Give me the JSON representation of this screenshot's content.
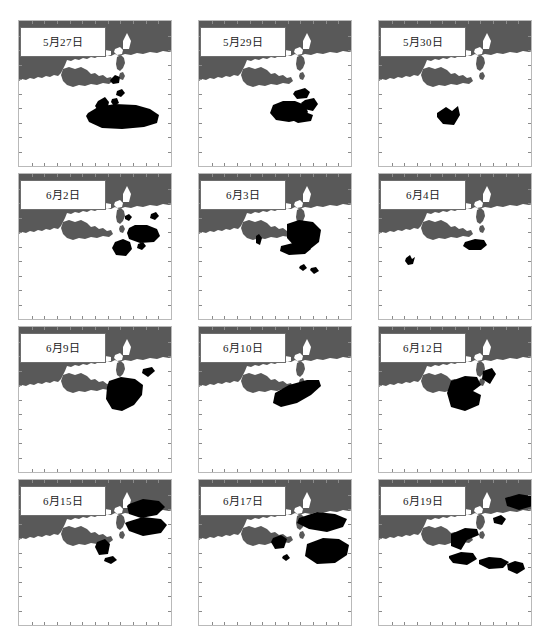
{
  "figure": {
    "title": "",
    "caption": "",
    "colors": {
      "land": "#595959",
      "sea": "#ffffff",
      "bloom": "#000000",
      "frame": "#b9b9b9",
      "tick": "#8a8a8a",
      "label_border": "#6d6d6d",
      "label_bg": "#ffffff",
      "text": "#1a1a1a"
    },
    "grid": {
      "rows": 4,
      "cols": 3,
      "panel_count": 12
    }
  },
  "chart_data": {
    "type": "map",
    "title": "",
    "xlabel": "",
    "ylabel": "",
    "legend": [
      {
        "label": "land",
        "color": "#595959"
      },
      {
        "label": "sea",
        "color": "#ffffff"
      },
      {
        "label": "bloom-patch",
        "color": "#000000"
      }
    ],
    "panels": [
      {
        "index": 0,
        "row": 1,
        "col": 1,
        "date_label": "5月27日",
        "month": 5,
        "day": 27,
        "patch_count": 6,
        "patch_area_relative": 0.105,
        "patches": [
          "M92,58 l4,-4 5,2 -1,6 -6,1 -3,-3 z",
          "M98,70 l5,-2 3,4 -4,4 -5,-2 z",
          "M79,80 l7,-4 4,5 -2,9 -8,1 -4,-6 z",
          "M93,78 l5,-1 2,5 -5,3 -3,-4 z",
          "M69,92 l10,-6 17,-3 21,1 14,4 9,6 -2,8 -13,4 -22,2 -20,-1 -13,-6 -3,-6 z",
          "M86,96 l9,-2 5,4 -4,5 -9,-1 -3,-4 z"
        ]
      },
      {
        "index": 1,
        "row": 1,
        "col": 2,
        "date_label": "5月29日",
        "month": 5,
        "day": 29,
        "patch_count": 4,
        "patch_area_relative": 0.09,
        "patches": [
          "M96,70 l10,-3 5,4 -3,6 -10,1 -4,-5 z",
          "M106,79 l9,-2 4,6 -5,7 -9,-2 -3,-6 z",
          "M74,84 l10,-4 12,0 10,4 3,7 -5,7 -14,3 -13,-2 -6,-7 z",
          "M93,92 l13,-1 8,3 -2,6 -13,2 -8,-4 z"
        ]
      },
      {
        "index": 2,
        "row": 1,
        "col": 3,
        "date_label": "5月30日",
        "month": 5,
        "day": 30,
        "patch_count": 1,
        "patch_area_relative": 0.018,
        "patches": [
          "M58,92 l9,-6 6,4 6,-5 2,9 -6,10 -11,-1 -6,-7 z"
        ]
      },
      {
        "index": 3,
        "row": 2,
        "col": 1,
        "date_label": "6月2日",
        "month": 6,
        "day": 2,
        "patch_count": 5,
        "patch_area_relative": 0.052,
        "patches": [
          "M106,42 l4,-2 3,3 -3,4 -4,-2 z",
          "M132,40 l5,-2 3,4 -4,4 -5,-2 z",
          "M110,54 l6,-3 12,0 10,4 3,7 -6,6 -14,1 -11,-4 -2,-6 z",
          "M119,70 l5,-2 3,4 -4,4 -5,-2 z",
          "M96,68 l8,-3 7,3 2,7 -6,7 -10,-1 -4,-7 z"
        ]
      },
      {
        "index": 4,
        "row": 2,
        "col": 2,
        "date_label": "6月3日",
        "month": 6,
        "day": 3,
        "patch_count": 5,
        "patch_area_relative": 0.078,
        "patches": [
          "M88,50 l12,-4 14,2 8,8 -2,12 -10,8 -13,-2 -9,-10 z",
          "M57,62 l3,-2 3,4 -2,7 -4,-2 z",
          "M82,72 l12,-3 14,1 4,5 -6,5 -16,1 -9,-4 z",
          "M101,92 l4,-2 3,4 -4,3 -4,-3 z",
          "M112,94 l5,-1 3,4 -5,3 -4,-4 z"
        ]
      },
      {
        "index": 5,
        "row": 2,
        "col": 3,
        "date_label": "6月4日",
        "month": 6,
        "day": 4,
        "patch_count": 2,
        "patch_area_relative": 0.016,
        "patches": [
          "M86,68 l10,-3 9,1 3,5 -6,5 -12,0 -6,-4 z",
          "M27,84 l4,-3 2,4 3,-2 -2,7 -5,1 -3,-4 z"
        ]
      },
      {
        "index": 6,
        "row": 3,
        "col": 1,
        "date_label": "6月9日",
        "month": 6,
        "day": 9,
        "patch_count": 2,
        "patch_area_relative": 0.062,
        "patches": [
          "M124,42 l9,-2 3,4 -7,6 -6,-4 z",
          "M90,54 l12,-4 14,2 8,6 -1,10 -8,10 -12,6 -10,-2 -6,-10 1,-12 z"
        ]
      },
      {
        "index": 7,
        "row": 3,
        "col": 2,
        "date_label": "6月10日",
        "month": 6,
        "day": 10,
        "patch_count": 1,
        "patch_area_relative": 0.055,
        "patches": [
          "M76,66 l14,-8 18,-5 12,0 2,6 -10,9 -14,8 -16,4 -8,-4 z"
        ]
      },
      {
        "index": 8,
        "row": 3,
        "col": 3,
        "date_label": "6月12日",
        "month": 6,
        "day": 12,
        "patch_count": 2,
        "patch_area_relative": 0.07,
        "patches": [
          "M104,44 l9,-3 4,6 -6,10 -8,-5 z",
          "M72,54 l14,-5 12,1 4,8 -8,6 8,4 -2,10 -14,6 -14,-4 -4,-14 z"
        ]
      },
      {
        "index": 9,
        "row": 4,
        "col": 1,
        "date_label": "6月15日",
        "month": 6,
        "day": 15,
        "patch_count": 4,
        "patch_area_relative": 0.074,
        "patches": [
          "M110,24 l14,-5 16,2 6,6 -8,8 -16,3 -12,-4 -2,-8 z",
          "M108,42 l16,-5 18,2 6,6 -6,8 -18,3 -14,-5 -4,-8 z",
          "M78,62 l8,-3 5,5 -2,10 -9,1 -4,-8 z",
          "M86,78 l8,-2 4,4 -6,4 -7,-3 z"
        ]
      },
      {
        "index": 10,
        "row": 4,
        "col": 2,
        "date_label": "6月17日",
        "month": 6,
        "day": 17,
        "patch_count": 4,
        "patch_area_relative": 0.112,
        "patches": [
          "M100,38 l18,-6 18,2 12,5 -4,8 -16,5 -18,-3 -12,-6 z",
          "M74,58 l8,-3 6,4 -3,9 -9,1 -4,-7 z",
          "M108,64 l16,-6 16,1 10,6 -2,10 -12,8 -18,1 -12,-8 z",
          "M84,76 l4,-2 3,4 -4,3 -4,-3 z"
        ]
      },
      {
        "index": 11,
        "row": 4,
        "col": 3,
        "date_label": "6月19日",
        "month": 6,
        "day": 19,
        "patch_count": 6,
        "patch_area_relative": 0.088,
        "patches": [
          "M126,18 l14,-4 12,2 2,10 -14,4 -12,-4 z",
          "M114,38 l8,-3 5,4 -4,6 -8,-2 z",
          "M72,54 l14,-6 12,1 2,6 -12,5 -6,10 -10,-4 z",
          "M70,76 l12,-4 12,1 4,6 -10,6 -14,-2 -4,-5 z",
          "M100,80 l10,-3 12,1 8,4 -6,6 -14,1 -10,-5 z",
          "M128,84 l8,-3 8,2 2,6 -8,5 -9,-4 z"
        ]
      }
    ]
  }
}
